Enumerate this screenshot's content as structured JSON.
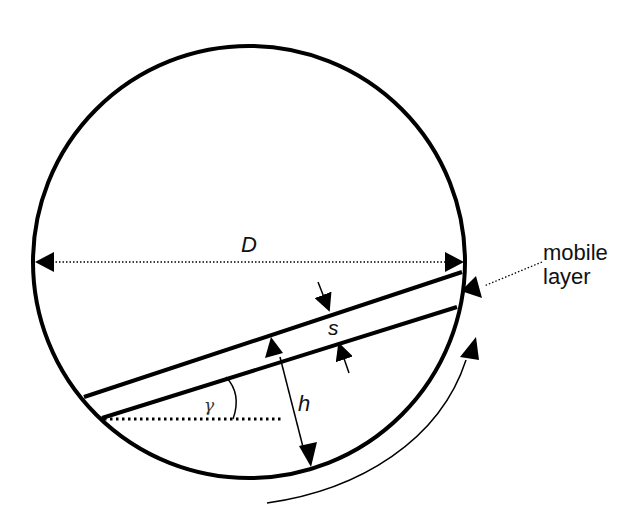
{
  "diagram": {
    "type": "rotating drum cross-section with inclined mobile layer",
    "labels": {
      "diameter": "D",
      "thickness": "s",
      "height": "h",
      "angle": "γ",
      "mobile_layer_line1": "mobile",
      "mobile_layer_line2": "layer"
    },
    "elements": [
      {
        "id": "drum",
        "shape": "circle",
        "center": [
          249,
          262
        ],
        "radius": 216
      },
      {
        "id": "diameter-arrow",
        "shape": "dotted double arrow",
        "from": [
          36,
          262
        ],
        "to": [
          463,
          262
        ],
        "label": "D"
      },
      {
        "id": "bed-surface-upper",
        "shape": "line",
        "from": [
          84,
          397
        ],
        "to": [
          462,
          272
        ]
      },
      {
        "id": "bed-surface-lower",
        "shape": "line",
        "from": [
          102,
          418
        ],
        "to": [
          457,
          307
        ]
      },
      {
        "id": "thickness-arrows",
        "label": "s"
      },
      {
        "id": "height-arrow",
        "shape": "double arrow",
        "from": [
          272,
          338
        ],
        "to": [
          309,
          466
        ],
        "label": "h"
      },
      {
        "id": "angle-reference",
        "shape": "dotted horizontal",
        "from": [
          104,
          418
        ],
        "to": [
          283,
          418
        ],
        "label": "γ"
      },
      {
        "id": "rotation-arrow",
        "shape": "curved arrow",
        "direction": "counter-clockwise (upward on right)"
      },
      {
        "id": "mobile-layer-pointer",
        "shape": "dotted leader arrow",
        "label": "mobile layer"
      }
    ],
    "colors": {
      "stroke": "#000000",
      "background": "#ffffff"
    }
  }
}
